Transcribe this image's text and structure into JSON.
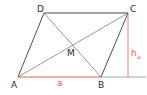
{
  "diagram": {
    "type": "parallelogram",
    "vertices": {
      "A": {
        "label": "A",
        "x": 18,
        "y": 77
      },
      "B": {
        "label": "B",
        "x": 101,
        "y": 77
      },
      "C": {
        "label": "C",
        "x": 128,
        "y": 13
      },
      "D": {
        "label": "D",
        "x": 44,
        "y": 13
      }
    },
    "intersection": {
      "label": "M",
      "x": 73,
      "y": 45
    },
    "side_label": "a",
    "height_label": "h",
    "height_subscript": "a",
    "colors": {
      "line": "#3a3a3a",
      "diagonal": "#6e6e6e",
      "highlight": "#e0634f",
      "baseline": "#8a8a8a"
    }
  }
}
